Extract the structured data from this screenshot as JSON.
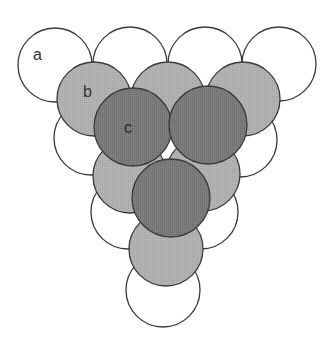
{
  "diagram": {
    "type": "stacked-sphere-layers",
    "colors": {
      "layer_a": "#ffffff",
      "layer_b": "#b0b0b0",
      "layer_c": "#7a7a7a",
      "stroke": "#3a3a3a"
    },
    "radius": 37,
    "layers": {
      "a": {
        "label": "a",
        "fill": "#ffffff",
        "circles": [
          {
            "cx": 55,
            "cy": 65
          },
          {
            "cx": 130,
            "cy": 64
          },
          {
            "cx": 205,
            "cy": 64
          },
          {
            "cx": 279,
            "cy": 64
          },
          {
            "cx": 91,
            "cy": 138
          },
          {
            "cx": 166,
            "cy": 138
          },
          {
            "cx": 240,
            "cy": 140
          },
          {
            "cx": 128,
            "cy": 212
          },
          {
            "cx": 201,
            "cy": 212
          },
          {
            "cx": 163,
            "cy": 290
          }
        ]
      },
      "b": {
        "label": "b",
        "fill": "#b0b0b0",
        "circles": [
          {
            "cx": 94,
            "cy": 99
          },
          {
            "cx": 168,
            "cy": 99
          },
          {
            "cx": 243,
            "cy": 99
          },
          {
            "cx": 130,
            "cy": 176
          },
          {
            "cx": 203,
            "cy": 174
          },
          {
            "cx": 166,
            "cy": 249
          }
        ]
      },
      "c": {
        "label": "c",
        "fill": "#7a7a7a",
        "radius": 39,
        "circles": [
          {
            "cx": 133,
            "cy": 127
          },
          {
            "cx": 208,
            "cy": 125
          },
          {
            "cx": 171,
            "cy": 198
          }
        ]
      }
    },
    "labels": [
      {
        "text": "a",
        "x": 33,
        "y": 60
      },
      {
        "text": "b",
        "x": 83,
        "y": 97
      },
      {
        "text": "c",
        "x": 124,
        "y": 133
      }
    ]
  }
}
